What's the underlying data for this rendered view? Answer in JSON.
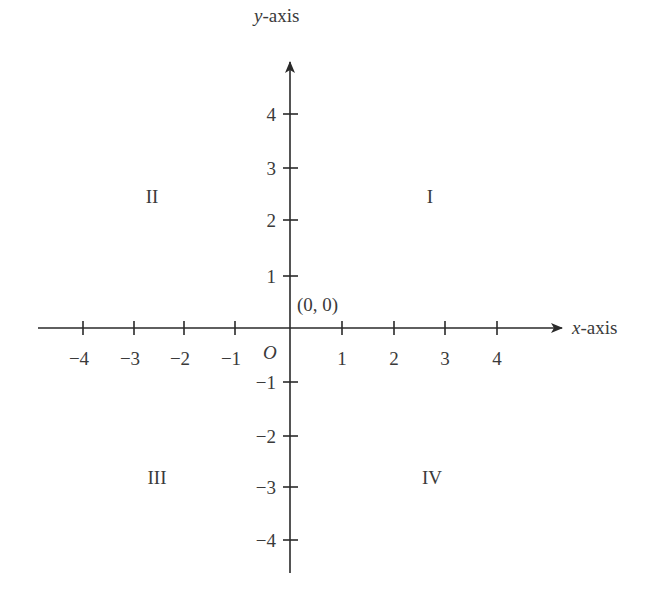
{
  "diagram": {
    "x_axis": {
      "label_var": "x",
      "label_suffix": "-axis",
      "ticks": [
        {
          "value": "−4",
          "px": 83
        },
        {
          "value": "−3",
          "px": 134
        },
        {
          "value": "−2",
          "px": 184
        },
        {
          "value": "−1",
          "px": 235
        },
        {
          "value": "1",
          "px": 342
        },
        {
          "value": "2",
          "px": 394
        },
        {
          "value": "3",
          "px": 445
        },
        {
          "value": "4",
          "px": 497
        }
      ]
    },
    "y_axis": {
      "label_var": "y",
      "label_suffix": "-axis",
      "ticks": [
        {
          "value": "4",
          "px": 114
        },
        {
          "value": "3",
          "px": 168
        },
        {
          "value": "2",
          "px": 220
        },
        {
          "value": "1",
          "px": 276
        },
        {
          "value": "−1",
          "px": 382
        },
        {
          "value": "−2",
          "px": 436
        },
        {
          "value": "−3",
          "px": 487
        },
        {
          "value": "−4",
          "px": 540
        }
      ]
    },
    "origin": {
      "symbol": "O",
      "coordinate_label": "(0, 0)"
    },
    "quadrants": {
      "q1": "I",
      "q2": "II",
      "q3": "III",
      "q4": "IV"
    }
  },
  "colors": {
    "ink": "#2a2a2a",
    "text": "#3a3a3a",
    "background": "#ffffff"
  }
}
